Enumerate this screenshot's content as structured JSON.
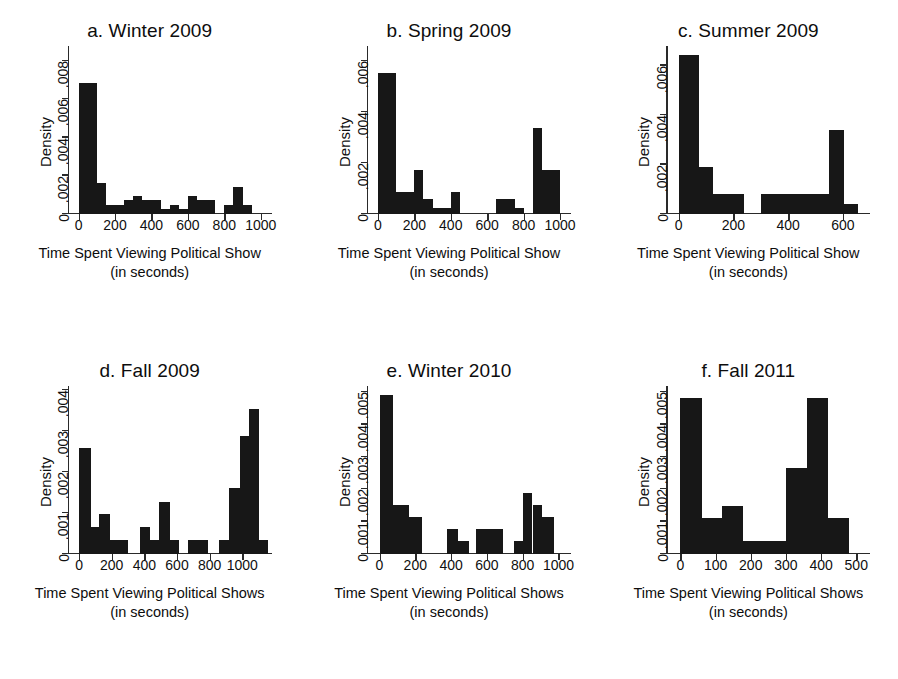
{
  "figure": {
    "background": "#ffffff",
    "bar_color": "#171717",
    "axis_color": "#2a2a2a",
    "rows": 2,
    "cols": 3
  },
  "chart_data": [
    {
      "type": "bar",
      "panel_id": "a",
      "title": "a. Winter 2009",
      "xlabel": "Time Spent Viewing Political Show",
      "xlabel_sub": "(in seconds)",
      "ylabel": "Density",
      "xlim": [
        -60,
        1060
      ],
      "ylim": [
        0,
        0.0088
      ],
      "xticks": [
        0,
        200,
        400,
        600,
        800,
        1000
      ],
      "xticklabels": [
        "0",
        "200",
        "400",
        "600",
        "800",
        "1000"
      ],
      "yticks": [
        0,
        0.002,
        0.004,
        0.006,
        0.008
      ],
      "yticklabels": [
        "0",
        ".002",
        ".004",
        ".006",
        ".008"
      ],
      "grid": false,
      "legend": "none",
      "bin_width": 50,
      "bins": [
        {
          "x0": 0,
          "x1": 100,
          "value": 0.00685
        },
        {
          "x0": 100,
          "x1": 150,
          "value": 0.00165
        },
        {
          "x0": 150,
          "x1": 250,
          "value": 0.00047
        },
        {
          "x0": 250,
          "x1": 300,
          "value": 0.00072
        },
        {
          "x0": 300,
          "x1": 350,
          "value": 0.00095
        },
        {
          "x0": 350,
          "x1": 450,
          "value": 0.00072
        },
        {
          "x0": 450,
          "x1": 500,
          "value": 0.00024
        },
        {
          "x0": 500,
          "x1": 550,
          "value": 0.00047
        },
        {
          "x0": 550,
          "x1": 600,
          "value": 0.00024
        },
        {
          "x0": 600,
          "x1": 650,
          "value": 0.00095
        },
        {
          "x0": 650,
          "x1": 750,
          "value": 0.00072
        },
        {
          "x0": 750,
          "x1": 800,
          "value": 0.0
        },
        {
          "x0": 800,
          "x1": 850,
          "value": 0.00047
        },
        {
          "x0": 850,
          "x1": 900,
          "value": 0.00143
        },
        {
          "x0": 900,
          "x1": 950,
          "value": 0.00047
        }
      ]
    },
    {
      "type": "bar",
      "panel_id": "b",
      "title": "b. Spring 2009",
      "xlabel": "Time Spent Viewing Political Show",
      "xlabel_sub": "(in seconds)",
      "ylabel": "Density",
      "xlim": [
        -60,
        1060
      ],
      "ylim": [
        0,
        0.0066
      ],
      "xticks": [
        0,
        200,
        400,
        600,
        800,
        1000
      ],
      "xticklabels": [
        "0",
        "200",
        "400",
        "600",
        "800",
        "1000"
      ],
      "yticks": [
        0,
        0.002,
        0.004,
        0.006
      ],
      "yticklabels": [
        "0",
        ".002",
        ".004",
        ".006"
      ],
      "grid": false,
      "legend": "none",
      "bin_width": 50,
      "bins": [
        {
          "x0": 0,
          "x1": 100,
          "value": 0.00555
        },
        {
          "x0": 100,
          "x1": 200,
          "value": 0.00085
        },
        {
          "x0": 200,
          "x1": 250,
          "value": 0.00172
        },
        {
          "x0": 250,
          "x1": 300,
          "value": 0.0006
        },
        {
          "x0": 300,
          "x1": 400,
          "value": 0.00025
        },
        {
          "x0": 400,
          "x1": 450,
          "value": 0.00085
        },
        {
          "x0": 450,
          "x1": 650,
          "value": 0.0
        },
        {
          "x0": 650,
          "x1": 750,
          "value": 0.0006
        },
        {
          "x0": 750,
          "x1": 800,
          "value": 0.00025
        },
        {
          "x0": 800,
          "x1": 850,
          "value": 0.0
        },
        {
          "x0": 850,
          "x1": 900,
          "value": 0.00338
        },
        {
          "x0": 900,
          "x1": 1000,
          "value": 0.00172
        }
      ]
    },
    {
      "type": "bar",
      "panel_id": "c",
      "title": "c. Summer 2009",
      "xlabel": "Time Spent Viewing Political Show",
      "xlabel_sub": "(in seconds)",
      "ylabel": "Density",
      "xlim": [
        -45,
        700
      ],
      "ylim": [
        0,
        0.0068
      ],
      "xticks": [
        0,
        200,
        400,
        600
      ],
      "xticklabels": [
        "0",
        "200",
        "400",
        "600"
      ],
      "yticks": [
        0,
        0.002,
        0.004,
        0.006
      ],
      "yticklabels": [
        "0",
        ".002",
        ".004",
        ".006"
      ],
      "grid": false,
      "legend": "none",
      "bin_width": 50,
      "bins": [
        {
          "x0": 0,
          "x1": 75,
          "value": 0.00645
        },
        {
          "x0": 75,
          "x1": 125,
          "value": 0.0019
        },
        {
          "x0": 125,
          "x1": 240,
          "value": 0.0008
        },
        {
          "x0": 240,
          "x1": 300,
          "value": 0.0
        },
        {
          "x0": 300,
          "x1": 550,
          "value": 0.0008
        },
        {
          "x0": 550,
          "x1": 605,
          "value": 0.00342
        },
        {
          "x0": 605,
          "x1": 655,
          "value": 0.0004
        }
      ]
    },
    {
      "type": "bar",
      "panel_id": "d",
      "title": "d. Fall 2009",
      "xlabel": "Time Spent Viewing Political Shows",
      "xlabel_sub": "(in seconds)",
      "ylabel": "Density",
      "xlim": [
        -70,
        1180
      ],
      "ylim": [
        0,
        0.0041
      ],
      "xticks": [
        0,
        200,
        400,
        600,
        800,
        1000
      ],
      "xticklabels": [
        "0",
        "200",
        "400",
        "600",
        "800",
        "1000"
      ],
      "yticks": [
        0,
        0.001,
        0.002,
        0.003,
        0.004
      ],
      "yticklabels": [
        "0",
        ".001",
        ".002",
        ".003",
        ".004"
      ],
      "grid": false,
      "legend": "none",
      "bin_width": 50,
      "bins": [
        {
          "x0": 0,
          "x1": 75,
          "value": 0.00258
        },
        {
          "x0": 75,
          "x1": 125,
          "value": 0.00067
        },
        {
          "x0": 125,
          "x1": 190,
          "value": 0.00097
        },
        {
          "x0": 190,
          "x1": 300,
          "value": 0.00034
        },
        {
          "x0": 300,
          "x1": 375,
          "value": 0.0
        },
        {
          "x0": 375,
          "x1": 435,
          "value": 0.00067
        },
        {
          "x0": 435,
          "x1": 490,
          "value": 0.00034
        },
        {
          "x0": 490,
          "x1": 555,
          "value": 0.00128
        },
        {
          "x0": 555,
          "x1": 615,
          "value": 0.00034
        },
        {
          "x0": 615,
          "x1": 670,
          "value": 0.0
        },
        {
          "x0": 670,
          "x1": 790,
          "value": 0.00034
        },
        {
          "x0": 790,
          "x1": 855,
          "value": 0.0
        },
        {
          "x0": 855,
          "x1": 920,
          "value": 0.00034
        },
        {
          "x0": 920,
          "x1": 985,
          "value": 0.0016
        },
        {
          "x0": 985,
          "x1": 1040,
          "value": 0.00288
        },
        {
          "x0": 1040,
          "x1": 1100,
          "value": 0.00355
        },
        {
          "x0": 1100,
          "x1": 1160,
          "value": 0.00034
        }
      ]
    },
    {
      "type": "bar",
      "panel_id": "e",
      "title": "e. Winter 2010",
      "xlabel": "Time Spent Viewing Political Shows",
      "xlabel_sub": "(in seconds)",
      "ylabel": "Density",
      "xlim": [
        -70,
        1070
      ],
      "ylim": [
        0,
        0.0052
      ],
      "xticks": [
        0,
        200,
        400,
        600,
        800,
        1000
      ],
      "xticklabels": [
        "0",
        "200",
        "400",
        "600",
        "800",
        "1000"
      ],
      "yticks": [
        0,
        0.001,
        0.002,
        0.003,
        0.004,
        0.005
      ],
      "yticklabels": [
        "0",
        ".001",
        ".002",
        ".003",
        ".004",
        ".005"
      ],
      "grid": false,
      "legend": "none",
      "bin_width": 50,
      "bins": [
        {
          "x0": 0,
          "x1": 75,
          "value": 0.00492
        },
        {
          "x0": 75,
          "x1": 165,
          "value": 0.00152
        },
        {
          "x0": 165,
          "x1": 240,
          "value": 0.00115
        },
        {
          "x0": 240,
          "x1": 375,
          "value": 0.0
        },
        {
          "x0": 375,
          "x1": 440,
          "value": 0.00078
        },
        {
          "x0": 440,
          "x1": 500,
          "value": 0.0004
        },
        {
          "x0": 500,
          "x1": 540,
          "value": 0.0
        },
        {
          "x0": 540,
          "x1": 690,
          "value": 0.00078
        },
        {
          "x0": 690,
          "x1": 750,
          "value": 0.0
        },
        {
          "x0": 750,
          "x1": 800,
          "value": 0.0004
        },
        {
          "x0": 800,
          "x1": 855,
          "value": 0.0019
        },
        {
          "x0": 855,
          "x1": 910,
          "value": 0.00152
        },
        {
          "x0": 910,
          "x1": 975,
          "value": 0.00115
        }
      ]
    },
    {
      "type": "bar",
      "panel_id": "f",
      "title": "f. Fall 2011",
      "xlabel": "Time Spent Viewing Political Shows",
      "xlabel_sub": "(in seconds)",
      "ylabel": "Density",
      "xlim": [
        -40,
        540
      ],
      "ylim": [
        0,
        0.0052
      ],
      "xticks": [
        0,
        100,
        200,
        300,
        400,
        500
      ],
      "xticklabels": [
        "0",
        "100",
        "200",
        "300",
        "400",
        "500"
      ],
      "yticks": [
        0,
        0.001,
        0.002,
        0.003,
        0.004,
        0.005
      ],
      "yticklabels": [
        "0",
        ".001",
        ".002",
        ".003",
        ".004",
        ".005"
      ],
      "grid": false,
      "legend": "none",
      "bin_width": 50,
      "bins": [
        {
          "x0": 0,
          "x1": 62,
          "value": 0.00483
        },
        {
          "x0": 62,
          "x1": 118,
          "value": 0.00113
        },
        {
          "x0": 118,
          "x1": 178,
          "value": 0.00148
        },
        {
          "x0": 178,
          "x1": 300,
          "value": 0.00039
        },
        {
          "x0": 300,
          "x1": 360,
          "value": 0.00265
        },
        {
          "x0": 360,
          "x1": 420,
          "value": 0.00483
        },
        {
          "x0": 420,
          "x1": 478,
          "value": 0.00113
        }
      ]
    }
  ]
}
